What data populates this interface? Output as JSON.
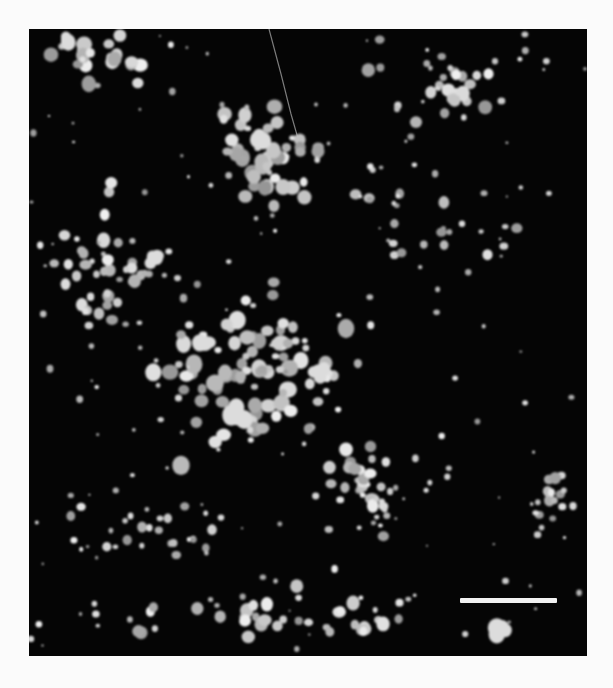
{
  "image": {
    "type": "dark-field micrograph",
    "background_color": "#050505",
    "particle_color": "#e6e6e6",
    "page_background": "#fbfbfb"
  },
  "scale_bar": {
    "x": 431,
    "y": 569,
    "width": 97,
    "height": 5,
    "color": "#f2f2f2",
    "label": ""
  },
  "fiber": {
    "points": "240,0 252,45 262,85 272,120"
  },
  "clusters": [
    {
      "name": "central-cluster",
      "cx": 225,
      "cy": 340,
      "rx": 130,
      "ry": 110,
      "count": 90,
      "rmin": 3,
      "rmax": 9
    },
    {
      "name": "upper-cluster",
      "cx": 235,
      "cy": 130,
      "rx": 85,
      "ry": 70,
      "count": 45,
      "rmin": 2.5,
      "rmax": 8
    },
    {
      "name": "left-cluster",
      "cx": 75,
      "cy": 230,
      "rx": 55,
      "ry": 90,
      "count": 40,
      "rmin": 2.5,
      "rmax": 7
    },
    {
      "name": "top-left-cluster",
      "cx": 70,
      "cy": 30,
      "rx": 70,
      "ry": 35,
      "count": 22,
      "rmin": 3,
      "rmax": 8
    },
    {
      "name": "top-right-cluster",
      "cx": 430,
      "cy": 60,
      "rx": 140,
      "ry": 55,
      "count": 30,
      "rmin": 2.5,
      "rmax": 7
    },
    {
      "name": "right-middle-cluster",
      "cx": 420,
      "cy": 180,
      "rx": 120,
      "ry": 90,
      "count": 25,
      "rmin": 2,
      "rmax": 6
    },
    {
      "name": "lower-middle-cluster",
      "cx": 340,
      "cy": 460,
      "rx": 80,
      "ry": 70,
      "count": 35,
      "rmin": 2.5,
      "rmax": 7
    },
    {
      "name": "right-edge-cluster",
      "cx": 525,
      "cy": 470,
      "rx": 35,
      "ry": 60,
      "count": 14,
      "rmin": 2.5,
      "rmax": 6
    },
    {
      "name": "bottom-cluster",
      "cx": 250,
      "cy": 585,
      "rx": 250,
      "ry": 40,
      "count": 45,
      "rmin": 2,
      "rmax": 7
    },
    {
      "name": "lower-left-cluster",
      "cx": 120,
      "cy": 500,
      "rx": 90,
      "ry": 60,
      "count": 28,
      "rmin": 2,
      "rmax": 5
    },
    {
      "name": "scattered-field",
      "cx": 279,
      "cy": 313,
      "rx": 279,
      "ry": 313,
      "count": 160,
      "rmin": 1,
      "rmax": 3.5
    }
  ],
  "blobs": [
    {
      "x": 471,
      "y": 600,
      "r": 12
    },
    {
      "x": 230,
      "y": 108,
      "r": 10
    },
    {
      "x": 205,
      "y": 384,
      "r": 11
    },
    {
      "x": 175,
      "y": 318,
      "r": 10
    },
    {
      "x": 290,
      "y": 344,
      "r": 10
    },
    {
      "x": 125,
      "y": 230,
      "r": 9
    },
    {
      "x": 40,
      "y": 12,
      "r": 9
    }
  ]
}
